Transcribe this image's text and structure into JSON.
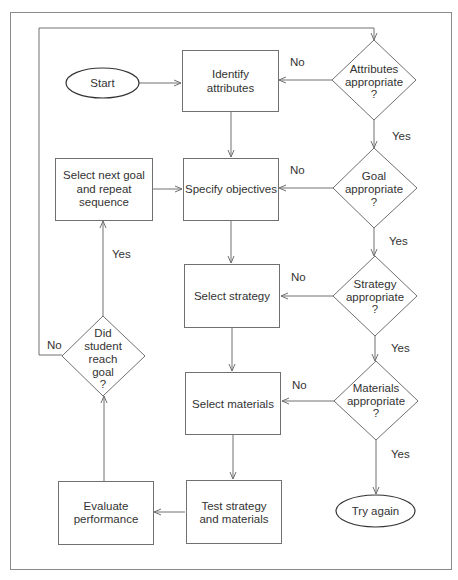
{
  "diagram": {
    "type": "flowchart",
    "colors": {
      "background": "#ffffff",
      "stroke": "#707070",
      "text": "#333333",
      "frame": "#8a8a8a"
    },
    "nodes": {
      "start": {
        "shape": "terminal",
        "lines": [
          "Start"
        ]
      },
      "identify": {
        "shape": "process",
        "lines": [
          "Identify",
          "attributes"
        ]
      },
      "specify": {
        "shape": "process",
        "lines": [
          "Specify objectives"
        ]
      },
      "select_strategy": {
        "shape": "process",
        "lines": [
          "Select strategy"
        ]
      },
      "select_materials": {
        "shape": "process",
        "lines": [
          "Select materials"
        ]
      },
      "test": {
        "shape": "process",
        "lines": [
          "Test strategy",
          "and materials"
        ]
      },
      "evaluate": {
        "shape": "process",
        "lines": [
          "Evaluate",
          "performance"
        ]
      },
      "next_goal": {
        "shape": "process",
        "lines": [
          "Select next goal",
          "and repeat",
          "sequence"
        ]
      },
      "d_attributes": {
        "shape": "decision",
        "lines": [
          "Attributes",
          "appropriate",
          "?"
        ]
      },
      "d_goal": {
        "shape": "decision",
        "lines": [
          "Goal",
          "appropriate",
          "?"
        ]
      },
      "d_strategy": {
        "shape": "decision",
        "lines": [
          "Strategy",
          "appropriate",
          "?"
        ]
      },
      "d_materials": {
        "shape": "decision",
        "lines": [
          "Materials",
          "appropriate",
          "?"
        ]
      },
      "d_student": {
        "shape": "decision",
        "lines": [
          "Did",
          "student",
          "reach",
          "goal",
          "?"
        ]
      },
      "try_again": {
        "shape": "terminal",
        "lines": [
          "Try again"
        ]
      }
    },
    "edges": [
      {
        "from": "start",
        "to": "identify",
        "label": ""
      },
      {
        "from": "identify",
        "to": "specify",
        "label": ""
      },
      {
        "from": "next_goal",
        "to": "specify",
        "label": ""
      },
      {
        "from": "specify",
        "to": "select_strategy",
        "label": ""
      },
      {
        "from": "select_strategy",
        "to": "select_materials",
        "label": ""
      },
      {
        "from": "select_materials",
        "to": "test",
        "label": ""
      },
      {
        "from": "test",
        "to": "evaluate",
        "label": ""
      },
      {
        "from": "evaluate",
        "to": "d_student",
        "label": ""
      },
      {
        "from": "d_student",
        "to": "next_goal",
        "label": "Yes"
      },
      {
        "from": "d_student",
        "to": "d_attributes",
        "label": "No"
      },
      {
        "from": "d_attributes",
        "to": "identify",
        "label": "No"
      },
      {
        "from": "d_attributes",
        "to": "d_goal",
        "label": "Yes"
      },
      {
        "from": "d_goal",
        "to": "specify",
        "label": "No"
      },
      {
        "from": "d_goal",
        "to": "d_strategy",
        "label": "Yes"
      },
      {
        "from": "d_strategy",
        "to": "select_strategy",
        "label": "No"
      },
      {
        "from": "d_strategy",
        "to": "d_materials",
        "label": "Yes"
      },
      {
        "from": "d_materials",
        "to": "select_materials",
        "label": "No"
      },
      {
        "from": "d_materials",
        "to": "try_again",
        "label": "Yes"
      }
    ],
    "edge_labels": {
      "yes": "Yes",
      "no": "No"
    }
  }
}
